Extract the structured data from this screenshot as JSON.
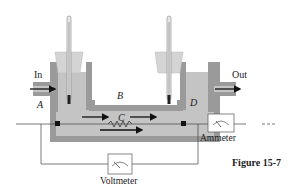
{
  "figure": {
    "caption": "Figure 15-7",
    "labels": {
      "inlet": "In",
      "outlet": "Out",
      "point_a": "A",
      "point_b": "B",
      "point_c": "C",
      "point_d": "D"
    },
    "instruments": {
      "voltmeter": "Voltmeter",
      "ammeter": "Ammeter"
    },
    "colors": {
      "insulation": "#9a9a9a",
      "fluid": "#c8c8c8",
      "cup": "#d4d4d4",
      "line": "#333333",
      "background": "#ffffff"
    }
  }
}
